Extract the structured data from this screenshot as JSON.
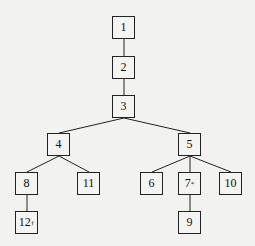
{
  "chart_data": {
    "type": "tree",
    "nodes": [
      {
        "id": "1",
        "label": "1",
        "x": 112,
        "y": 16
      },
      {
        "id": "2",
        "label": "2",
        "x": 112,
        "y": 56
      },
      {
        "id": "3",
        "label": "3",
        "x": 112,
        "y": 95
      },
      {
        "id": "4",
        "label": "4",
        "x": 47,
        "y": 133
      },
      {
        "id": "5",
        "label": "5",
        "x": 178,
        "y": 133
      },
      {
        "id": "8",
        "label": "8",
        "x": 15,
        "y": 172
      },
      {
        "id": "11",
        "label": "11",
        "x": 77,
        "y": 172
      },
      {
        "id": "6",
        "label": "6",
        "x": 140,
        "y": 172
      },
      {
        "id": "7",
        "label": "7",
        "mark": "*",
        "x": 178,
        "y": 172
      },
      {
        "id": "10",
        "label": "10",
        "x": 219,
        "y": 172
      },
      {
        "id": "12",
        "label": "12",
        "mark": "†",
        "x": 15,
        "y": 211
      },
      {
        "id": "9",
        "label": "9",
        "x": 178,
        "y": 211
      }
    ],
    "edges": [
      [
        "1",
        "2"
      ],
      [
        "2",
        "3"
      ],
      [
        "3",
        "4"
      ],
      [
        "3",
        "5"
      ],
      [
        "4",
        "8"
      ],
      [
        "4",
        "11"
      ],
      [
        "8",
        "12"
      ],
      [
        "5",
        "6"
      ],
      [
        "5",
        "7"
      ],
      [
        "5",
        "10"
      ],
      [
        "7",
        "9"
      ]
    ]
  }
}
